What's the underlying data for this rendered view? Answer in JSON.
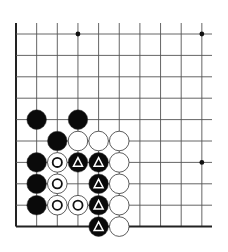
{
  "diagram": {
    "type": "go-board-corner",
    "corner": "bottom-left",
    "grid": {
      "columns": 10,
      "rows": 10,
      "x0": 16,
      "y0": 34,
      "dx": 20.65,
      "dy": 21.4,
      "right_extent": 212,
      "top_extent": 23,
      "line_color": "#555555",
      "edge_color": "#222222"
    },
    "star_points": [
      {
        "col": 3,
        "row": 0
      },
      {
        "col": 9,
        "row": 0
      },
      {
        "col": 9,
        "row": 6
      }
    ],
    "stones": [
      {
        "col": 1,
        "row": 4,
        "color": "black",
        "mark": ""
      },
      {
        "col": 3,
        "row": 4,
        "color": "black",
        "mark": ""
      },
      {
        "col": 2,
        "row": 5,
        "color": "black",
        "mark": ""
      },
      {
        "col": 3,
        "row": 5,
        "color": "white",
        "mark": ""
      },
      {
        "col": 4,
        "row": 5,
        "color": "white",
        "mark": ""
      },
      {
        "col": 5,
        "row": 5,
        "color": "white",
        "mark": ""
      },
      {
        "col": 1,
        "row": 6,
        "color": "black",
        "mark": ""
      },
      {
        "col": 2,
        "row": 6,
        "color": "white",
        "mark": "circle"
      },
      {
        "col": 3,
        "row": 6,
        "color": "black",
        "mark": "triangle"
      },
      {
        "col": 4,
        "row": 6,
        "color": "black",
        "mark": "triangle"
      },
      {
        "col": 5,
        "row": 6,
        "color": "white",
        "mark": ""
      },
      {
        "col": 1,
        "row": 7,
        "color": "black",
        "mark": ""
      },
      {
        "col": 2,
        "row": 7,
        "color": "white",
        "mark": "circle"
      },
      {
        "col": 4,
        "row": 7,
        "color": "black",
        "mark": "triangle"
      },
      {
        "col": 5,
        "row": 7,
        "color": "white",
        "mark": ""
      },
      {
        "col": 1,
        "row": 8,
        "color": "black",
        "mark": ""
      },
      {
        "col": 2,
        "row": 8,
        "color": "white",
        "mark": "circle"
      },
      {
        "col": 3,
        "row": 8,
        "color": "white",
        "mark": "circle"
      },
      {
        "col": 4,
        "row": 8,
        "color": "black",
        "mark": "triangle"
      },
      {
        "col": 5,
        "row": 8,
        "color": "white",
        "mark": ""
      },
      {
        "col": 4,
        "row": 9,
        "color": "black",
        "mark": "triangle"
      },
      {
        "col": 5,
        "row": 9,
        "color": "white",
        "mark": ""
      }
    ],
    "colors": {
      "black_stone": "#0a0a0a",
      "white_stone": "#ffffff",
      "stone_outline": "#333333",
      "mark_on_black": "#ffffff",
      "mark_on_white": "#111111"
    }
  }
}
